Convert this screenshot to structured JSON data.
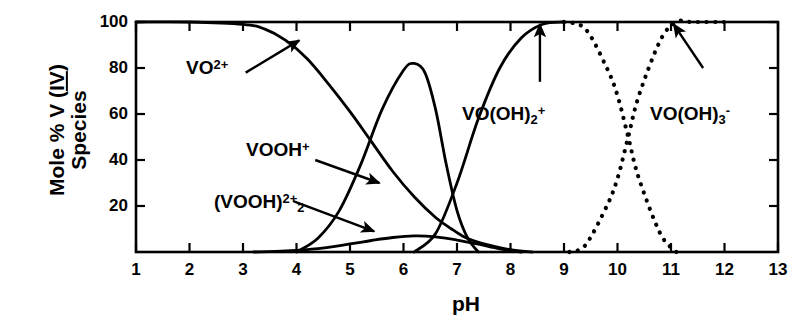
{
  "chart_data": {
    "type": "line",
    "title": "",
    "xlabel": "pH",
    "ylabel_line1": "Mole % V (IV)",
    "ylabel_line2": "Species",
    "ylabel_underlined_part": "IV",
    "xlim": [
      1,
      13
    ],
    "ylim": [
      0,
      100
    ],
    "xticks": [
      1,
      2,
      3,
      4,
      5,
      6,
      7,
      8,
      9,
      10,
      11,
      12,
      13
    ],
    "xtick_labels": [
      "1",
      "2",
      "3",
      "4",
      "5",
      "6",
      "7",
      "8",
      "9",
      "10",
      "11",
      "12",
      "13"
    ],
    "yticks": [
      20,
      40,
      60,
      80,
      100
    ],
    "ytick_labels": [
      "20",
      "40",
      "60",
      "80",
      "100"
    ],
    "grid": false,
    "legend_position": "inline-annotations",
    "frame": "box-all-four-sides-inward-ticks",
    "series": [
      {
        "name": "VO2+",
        "label_text": "VO",
        "label_sup": "2+",
        "style": "solid",
        "x": [
          1.0,
          2.0,
          3.0,
          3.4,
          3.8,
          4.2,
          4.6,
          5.0,
          5.4,
          5.8,
          6.2,
          6.6,
          6.9,
          7.1,
          7.3,
          7.6,
          8.0,
          8.4
        ],
        "values": [
          100,
          100,
          99,
          97,
          92,
          84,
          73,
          61,
          48,
          35,
          24,
          15,
          10,
          7,
          5,
          3,
          1,
          0
        ]
      },
      {
        "name": "(VOOH)2 2+",
        "label_text": "(VOOH)",
        "label_sub": "2",
        "label_sup": "2+",
        "style": "solid",
        "x": [
          3.2,
          3.8,
          4.4,
          5.0,
          5.4,
          5.8,
          6.2,
          6.6,
          7.0,
          7.4,
          7.8,
          8.2
        ],
        "values": [
          0,
          0.5,
          1.5,
          3.5,
          5.0,
          6.3,
          7.0,
          6.6,
          5.2,
          3.4,
          1.4,
          0
        ]
      },
      {
        "name": "VOOH+",
        "label_text": "VOOH",
        "label_sup": "+",
        "style": "solid",
        "x": [
          4.0,
          4.4,
          4.8,
          5.2,
          5.6,
          6.0,
          6.2,
          6.4,
          6.6,
          6.8,
          7.0,
          7.2,
          7.4
        ],
        "values": [
          0,
          6,
          18,
          38,
          62,
          79,
          82,
          78,
          62,
          38,
          18,
          6,
          0
        ]
      },
      {
        "name": "VO(OH)2+",
        "label_text": "VO(OH)",
        "label_sub": "2",
        "label_sup": "+",
        "style": "solid-then-dotted",
        "x": [
          6.2,
          6.6,
          7.0,
          7.4,
          7.8,
          8.2,
          8.6,
          9.0,
          9.4,
          9.8,
          10.0,
          10.2,
          10.4,
          10.8,
          11.1
        ],
        "values": [
          0,
          8,
          30,
          58,
          80,
          93,
          99,
          100,
          97,
          80,
          68,
          50,
          32,
          8,
          0
        ]
      },
      {
        "name": "VO(OH)3-",
        "label_text": "VO(OH)",
        "label_sub": "3",
        "label_sup": "-",
        "style": "dotted",
        "x": [
          9.1,
          9.4,
          9.8,
          10.0,
          10.2,
          10.4,
          10.8,
          11.1,
          11.4,
          12.0
        ],
        "values": [
          0,
          3,
          20,
          32,
          50,
          68,
          92,
          100,
          100,
          100
        ]
      }
    ],
    "annotations": [
      {
        "name": "arrow-vo2plus",
        "from": [
          3.05,
          78
        ],
        "to": [
          4.05,
          92
        ]
      },
      {
        "name": "arrow-voohplus",
        "from": [
          4.35,
          40
        ],
        "to": [
          5.55,
          30
        ]
      },
      {
        "name": "arrow-voohdimer",
        "from": [
          3.95,
          22
        ],
        "to": [
          5.45,
          9
        ]
      },
      {
        "name": "arrow-vooh2plus",
        "from": [
          8.55,
          74
        ],
        "to": [
          8.55,
          99
        ]
      },
      {
        "name": "arrow-vooh3minus",
        "from": [
          11.6,
          80
        ],
        "to": [
          11.05,
          99
        ]
      }
    ]
  },
  "labels": {
    "series_vo2plus": {
      "base": "VO",
      "sup": "2+"
    },
    "series_voohplus": {
      "base": "VOOH",
      "sup": "+"
    },
    "series_voohdimer": {
      "base": "(VOOH)",
      "sub": "2",
      "sup": "2+"
    },
    "series_vooh2plus": {
      "base": "VO(OH)",
      "sub": "2",
      "sup": "+"
    },
    "series_vooh3minus": {
      "base": "VO(OH)",
      "sub": "3",
      "sup": "-"
    }
  },
  "axis": {
    "x_title": "pH",
    "y_title_line1_a": "Mole % V (",
    "y_title_line1_b": "IV",
    "y_title_line1_c": ")",
    "y_title_line2": "Species"
  }
}
